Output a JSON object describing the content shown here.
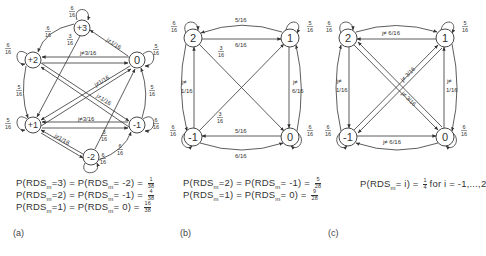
{
  "panels": [
    {
      "id": "a",
      "caption": "(a)",
      "nodes": [
        {
          "label": "+3"
        },
        {
          "label": "+2"
        },
        {
          "label": "0"
        },
        {
          "label": "+1"
        },
        {
          "label": "-1"
        },
        {
          "label": "-2"
        }
      ],
      "self_loops": {
        "p3": {
          "num": "6",
          "den": "16"
        },
        "p2": {
          "num": "6",
          "den": "16"
        },
        "z0": {
          "num": "5",
          "den": "16"
        },
        "p1": {
          "num": "5",
          "den": "16"
        },
        "m1": {
          "num": "6",
          "den": "16"
        },
        "m2": {
          "num": "6",
          "den": "16"
        }
      },
      "edge_labels": {
        "p3_p2": {
          "num": "6",
          "den": "16"
        },
        "p3_p1": {
          "num": "3",
          "den": "16"
        },
        "z0_p3": "j≠1/16",
        "p2_z0": "j≠3/16",
        "p2_p1": {
          "num": "5",
          "den": "16"
        },
        "z0_m1": {
          "num": "5",
          "den": "16"
        },
        "diag1": "j≠1/16",
        "diag2": "j≠1/16",
        "p1_m1": "j≠3/16",
        "m2_p1": "j≠1/16",
        "m2_z0": {
          "num": "3",
          "den": "16"
        },
        "m2_m1": {
          "num": "6",
          "den": "16"
        }
      },
      "formulas": [
        {
          "lhs": "P(RDS",
          "sub": "m",
          "a": "=3) = P(RDS",
          "sub2": "m",
          "b": "= -2) =",
          "num": "1",
          "den": "38"
        },
        {
          "lhs": "P(RDS",
          "sub": "m",
          "a": "=2) = P(RDS",
          "sub2": "m",
          "b": "= -1) =",
          "num": "4",
          "den": "38"
        },
        {
          "lhs": "P(RDS",
          "sub": "m",
          "a": "=1) = P(RDS",
          "sub2": "m",
          "b": "= 0) =",
          "num": "16",
          "den": "38"
        }
      ]
    },
    {
      "id": "b",
      "caption": "(b)",
      "nodes": [
        {
          "label": "2"
        },
        {
          "label": "1"
        },
        {
          "label": "-1"
        },
        {
          "label": "0"
        }
      ],
      "self_loops": {
        "n2": {
          "num": "6",
          "den": "16"
        },
        "n1": {
          "num": "5",
          "den": "16"
        },
        "m1": {
          "num": "6",
          "den": "16"
        },
        "n0": {
          "num": "6",
          "den": "16"
        }
      },
      "edge_labels": {
        "top_arc": "5/16",
        "top_straight": "6/16",
        "diag_2_0": {
          "num": "3",
          "den": "16"
        },
        "diag_m1_1": {
          "num": "3",
          "den": "16"
        },
        "left": "j≠ 1/16",
        "right": "j≠ 6/16",
        "bottom_straight": "5/16",
        "bottom_arc": "6/16"
      },
      "formulas": [
        {
          "lhs": "P(RDS",
          "sub": "m",
          "a": "=2) = P(RDS",
          "sub2": "m",
          "b": "= -1) =",
          "num": "5",
          "den": "28"
        },
        {
          "lhs": "P(RDS",
          "sub": "m",
          "a": "=1) = P(RDS",
          "sub2": "m",
          "b": "= 0) =",
          "num": "9",
          "den": "28"
        }
      ]
    },
    {
      "id": "c",
      "caption": "(c)",
      "nodes": [
        {
          "label": "2"
        },
        {
          "label": "1"
        },
        {
          "label": "-1"
        },
        {
          "label": "0"
        }
      ],
      "self_loops": {
        "n2": {
          "num": "6",
          "den": "16"
        },
        "n1": {
          "num": "5",
          "den": "16"
        },
        "m1": {
          "num": "6",
          "den": "16"
        },
        "n0": {
          "num": "6",
          "den": "16"
        }
      },
      "edge_labels": {
        "top": "j≠ 6/16",
        "diag1": "j≠ 3/16",
        "diag2": "j≠ 3/16",
        "left": "j≠ 1/16",
        "right": "j≠ 1/16",
        "bottom": "j≠ 6/16"
      },
      "formulas": [
        {
          "text": "P(RDS",
          "sub": "m",
          "a": "= i) =",
          "num": "1",
          "den": "4",
          "b": "for  i = -1,...,2"
        }
      ]
    }
  ]
}
